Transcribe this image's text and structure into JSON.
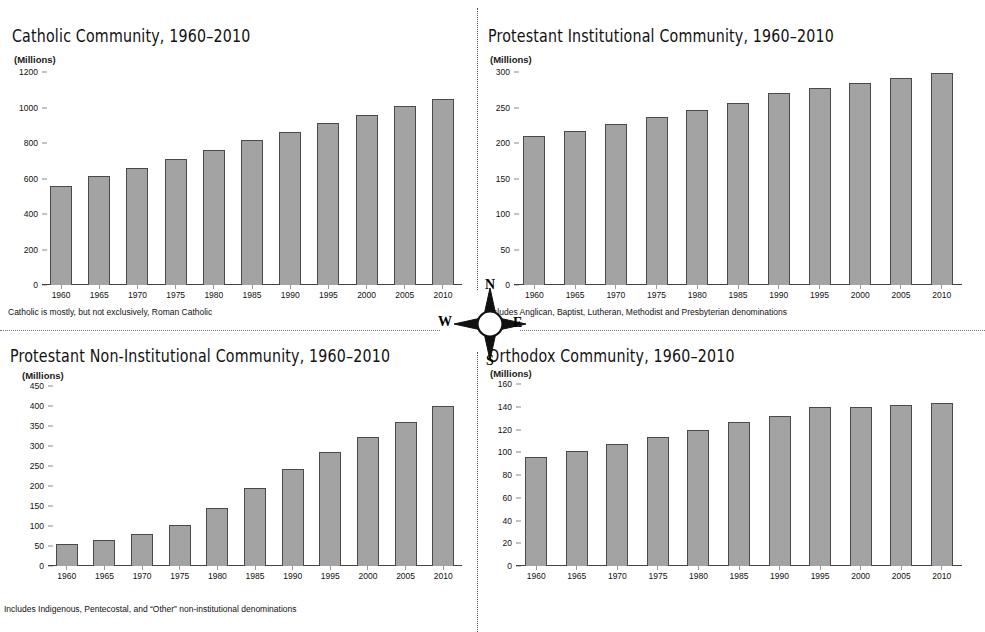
{
  "compass": {
    "north": "N",
    "south": "S",
    "east": "E",
    "west": "W",
    "icon": "compass-rose-icon"
  },
  "axis_unit_label": "(Millions)",
  "chart_data": [
    {
      "id": "catholic",
      "type": "bar",
      "title": "Catholic Community, 1960–2010",
      "ylabel": "(Millions)",
      "xlabel": "",
      "note": "Catholic is mostly, but not exclusively, Roman Catholic",
      "categories": [
        "1960",
        "1965",
        "1970",
        "1975",
        "1980",
        "1985",
        "1990",
        "1995",
        "2000",
        "2005",
        "2010"
      ],
      "values": [
        560,
        612,
        660,
        712,
        762,
        815,
        863,
        910,
        960,
        1007,
        1050
      ],
      "yticks": [
        0,
        200,
        400,
        600,
        800,
        1000,
        1200
      ],
      "ylim": [
        0,
        1200
      ],
      "grid": false,
      "legend": "none"
    },
    {
      "id": "protestant-institutional",
      "type": "bar",
      "title": "Protestant Institutional Community, 1960–2010",
      "ylabel": "(Millions)",
      "xlabel": "",
      "note": "Includes Anglican, Baptist, Lutheran, Methodist and Presbyterian denominations",
      "categories": [
        "1960",
        "1965",
        "1970",
        "1975",
        "1980",
        "1985",
        "1990",
        "1995",
        "2000",
        "2005",
        "2010"
      ],
      "values": [
        210,
        217,
        227,
        237,
        246,
        257,
        270,
        278,
        285,
        291,
        298
      ],
      "yticks": [
        0,
        50,
        100,
        150,
        200,
        250,
        300
      ],
      "ylim": [
        0,
        300
      ],
      "grid": false,
      "legend": "none"
    },
    {
      "id": "protestant-non-institutional",
      "type": "bar",
      "title": "Protestant Non-Institutional Community, 1960–2010",
      "ylabel": "(Millions)",
      "xlabel": "",
      "note": "Includes Indigenous, Pentecostal, and “Other” non-institutional denominations",
      "categories": [
        "1960",
        "1965",
        "1970",
        "1975",
        "1980",
        "1985",
        "1990",
        "1995",
        "2000",
        "2005",
        "2010"
      ],
      "values": [
        55,
        65,
        81,
        103,
        144,
        194,
        242,
        284,
        322,
        361,
        400
      ],
      "yticks": [
        0,
        50,
        100,
        150,
        200,
        250,
        300,
        350,
        400,
        450
      ],
      "ylim": [
        0,
        450
      ],
      "grid": false,
      "legend": "none"
    },
    {
      "id": "orthodox",
      "type": "bar",
      "title": "Orthodox Community, 1960–2010",
      "ylabel": "(Millions)",
      "xlabel": "",
      "note": "",
      "categories": [
        "1960",
        "1965",
        "1970",
        "1975",
        "1980",
        "1985",
        "1990",
        "1995",
        "2000",
        "2005",
        "2010"
      ],
      "values": [
        96,
        101,
        107.5,
        113,
        120,
        127,
        131.5,
        139.5,
        139.5,
        141.5,
        143.5
      ],
      "yticks": [
        0,
        20,
        40,
        60,
        80,
        100,
        120,
        140,
        160
      ],
      "ylim": [
        0,
        160
      ],
      "grid": false,
      "legend": "none"
    }
  ],
  "colors": {
    "bar_fill": "#a3a3a3",
    "bar_stroke": "#4a4a4a",
    "axis": "#444444",
    "text": "#111111",
    "background": "#ffffff"
  }
}
